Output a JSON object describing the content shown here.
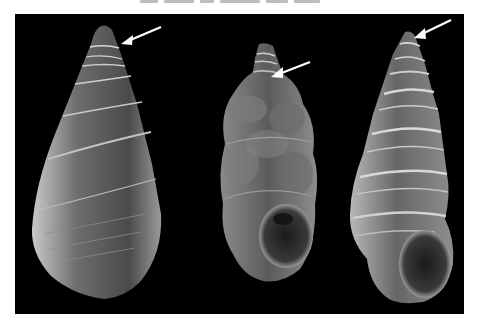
{
  "figure": {
    "type": "SEM micrograph panel",
    "background": "#000000",
    "page_background": "#ffffff",
    "caption_cropped": true,
    "specimens": [
      {
        "id": "shell-left",
        "description": "smooth elongate conical gastropod shell with flat whorls and fine growth lines",
        "arrow": {
          "target": "apex/protoconch",
          "color": "#ffffff"
        }
      },
      {
        "id": "shell-middle",
        "description": "small turreted shell with encrusted/rough whorls and visible round aperture",
        "arrow": {
          "target": "apex/protoconch",
          "color": "#ffffff"
        }
      },
      {
        "id": "shell-right",
        "description": "tall turriform shell with strong spiral keels/carinae and rounded aperture",
        "arrow": {
          "target": "apex/protoconch",
          "color": "#ffffff"
        }
      }
    ],
    "arrow_count": 3
  }
}
